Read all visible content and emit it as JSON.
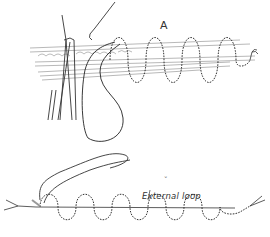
{
  "figure": {
    "type": "surgical-illustration",
    "panels": [
      {
        "id": "A",
        "label": "A",
        "description": "running (continuous) suture through tissue layers with forceps and needle holder"
      },
      {
        "id": "B",
        "label": "˘",
        "annotation": "External loop",
        "description": "continuous suture line with external loop"
      }
    ],
    "colors": {
      "ink": "#333333",
      "tissue": "#888888",
      "background": "#ffffff"
    }
  }
}
